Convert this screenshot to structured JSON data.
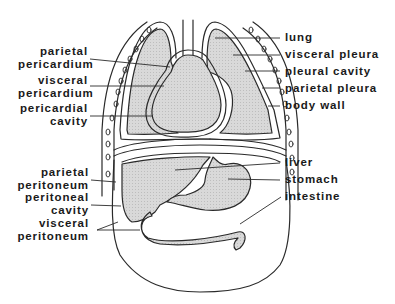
{
  "figure": {
    "colors": {
      "outline": "#2a2a2a",
      "organ_fill": "#d4d4d4",
      "background": "#ffffff"
    }
  },
  "labels_left": [
    {
      "id": "parietal-pericardium",
      "line1": "parietal",
      "line2": "pericardium"
    },
    {
      "id": "visceral-pericardium",
      "line1": "visceral",
      "line2": "pericardium"
    },
    {
      "id": "pericardial-cavity",
      "line1": "pericardial",
      "line2": "cavity"
    },
    {
      "id": "parietal-peritoneum",
      "line1": "parietal",
      "line2": "peritoneum"
    },
    {
      "id": "peritoneal-cavity",
      "line1": "peritoneal",
      "line2": "cavity"
    },
    {
      "id": "visceral-peritoneum",
      "line1": "visceral",
      "line2": "peritoneum"
    }
  ],
  "labels_right": [
    {
      "id": "lung",
      "text": "lung"
    },
    {
      "id": "visceral-pleura",
      "text": "visceral pleura"
    },
    {
      "id": "pleural-cavity",
      "text": "pleural cavity"
    },
    {
      "id": "parietal-pleura",
      "text": "parietal pleura"
    },
    {
      "id": "body-wall",
      "text": "body wall"
    },
    {
      "id": "liver",
      "text": "liver"
    },
    {
      "id": "stomach",
      "text": "stomach"
    },
    {
      "id": "intestine",
      "text": "intestine"
    }
  ]
}
